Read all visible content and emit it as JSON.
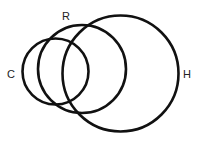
{
  "diagram": {
    "type": "venn",
    "stroke_color": "#111111",
    "circles": [
      {
        "label": "C",
        "cx": 55.5,
        "cy": 71.5,
        "r": 33
      },
      {
        "label": "R",
        "cx": 82,
        "cy": 69,
        "r": 44
      },
      {
        "label": "H",
        "cx": 120.5,
        "cy": 73.5,
        "r": 58
      }
    ],
    "labels": {
      "c": "C",
      "r": "R",
      "h": "H"
    }
  }
}
